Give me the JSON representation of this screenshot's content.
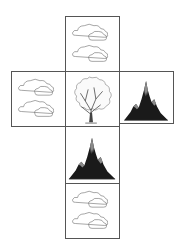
{
  "diagram": {
    "type": "cube-net",
    "faces": [
      {
        "id": "top",
        "content": "clouds",
        "row": 0,
        "col": 1
      },
      {
        "id": "left",
        "content": "clouds",
        "row": 1,
        "col": 0
      },
      {
        "id": "center",
        "content": "tree",
        "row": 1,
        "col": 1
      },
      {
        "id": "right",
        "content": "mountain",
        "row": 1,
        "col": 2
      },
      {
        "id": "below-center",
        "content": "mountain",
        "row": 2,
        "col": 1
      },
      {
        "id": "bottom",
        "content": "clouds",
        "row": 3,
        "col": 1
      }
    ],
    "colors": {
      "border": "#555555",
      "mountain_dark": "#1a1a1a",
      "mountain_peak": "#8a8a8a",
      "outline": "#666666"
    }
  }
}
